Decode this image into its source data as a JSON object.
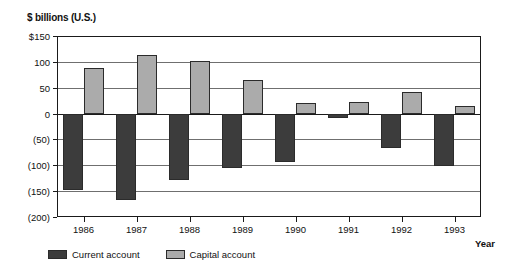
{
  "chart_data": {
    "type": "bar",
    "title": "$ billions (U.S.)",
    "xlabel": "Year",
    "ylabel": "$ billions (U.S.)",
    "categories": [
      "1986",
      "1987",
      "1988",
      "1989",
      "1990",
      "1991",
      "1992",
      "1993"
    ],
    "series": [
      {
        "name": "Current account",
        "color": "#3c3c3c",
        "values": [
          -148,
          -168,
          -128,
          -105,
          -94,
          -8,
          -67,
          -101
        ]
      },
      {
        "name": "Capital account",
        "color": "#ababab",
        "values": [
          88,
          113,
          102,
          65,
          20,
          22,
          42,
          15
        ]
      }
    ],
    "ylim": [
      -200,
      150
    ],
    "ytick_values": [
      150,
      100,
      50,
      0,
      -50,
      -100,
      -150,
      -200
    ],
    "ytick_labels": [
      "$150",
      "100",
      "50",
      "0",
      "(50)",
      "(100)",
      "(150)",
      "(200)"
    ],
    "grid": true,
    "legend_position": "bottom-left"
  }
}
